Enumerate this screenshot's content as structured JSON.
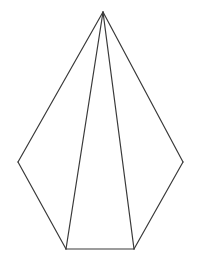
{
  "figure": {
    "type": "line-drawing",
    "canvas": {
      "width": 209,
      "height": 263,
      "background_color": "#ffffff"
    },
    "style": {
      "stroke_color": "#3a3a3a",
      "stroke_width": 1.2,
      "fill_color": "none"
    },
    "vertices": {
      "apex": {
        "label": "apex",
        "x": 103,
        "y": 12
      },
      "left": {
        "label": "left-base-vertex",
        "x": 18,
        "y": 162
      },
      "right": {
        "label": "right-base-vertex",
        "x": 183,
        "y": 162
      },
      "bottom_left": {
        "label": "bottom-left-base-vertex",
        "x": 66,
        "y": 249
      },
      "bottom_right": {
        "label": "bottom-right-base-vertex",
        "x": 134,
        "y": 249
      }
    },
    "edges": [
      {
        "name": "apex-to-left",
        "from": "apex",
        "to": "left",
        "path": "103,12 18,162"
      },
      {
        "name": "apex-to-bottom-left",
        "from": "apex",
        "to": "bottom_left",
        "path": "103,12 66,249"
      },
      {
        "name": "apex-to-bottom-right",
        "from": "apex",
        "to": "bottom_right",
        "path": "103,12 134,249"
      },
      {
        "name": "apex-to-right",
        "from": "apex",
        "to": "right",
        "path": "103,12 183,162"
      },
      {
        "name": "left-to-bottom-left",
        "from": "left",
        "to": "bottom_left",
        "path": "18,162 66,249"
      },
      {
        "name": "base-bottom",
        "from": "bottom_left",
        "to": "bottom_right",
        "path": "66,249 134,249"
      },
      {
        "name": "bottom-right-to-right",
        "from": "bottom_right",
        "to": "right",
        "path": "134,249 183,249"
      }
    ],
    "outline_polygon": "103,12 183,162 134,249 66,249 18,162",
    "front_face_polygon": "103,12 134,249 66,249",
    "annotations": [],
    "labels": []
  }
}
